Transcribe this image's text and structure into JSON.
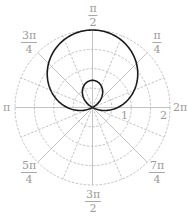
{
  "chart_data": {
    "type": "line",
    "subtype": "polar",
    "title": "",
    "equation_estimate": "r = 0.65 + 1.35 sin(theta)",
    "series": [
      {
        "name": "curve",
        "color": "#1a1a1a",
        "a": 0.65,
        "b": 1.35,
        "theta_range": [
          0,
          6.2832
        ],
        "samples": 360
      }
    ],
    "radial_axis": {
      "range": [
        0,
        2
      ],
      "rings": [
        0.5,
        1,
        1.5,
        2
      ],
      "tick_labels": [
        "1",
        "2"
      ],
      "ring_style": "dashed"
    },
    "angular_axis": {
      "tick_labels": [
        {
          "angle": "pi/4",
          "num": "π",
          "den": "4"
        },
        {
          "angle": "pi/2",
          "num": "π",
          "den": "2"
        },
        {
          "angle": "3pi/4",
          "num": "3π",
          "den": "4"
        },
        {
          "angle": "pi",
          "text": "π"
        },
        {
          "angle": "5pi/4",
          "num": "5π",
          "den": "4"
        },
        {
          "angle": "3pi/2",
          "num": "3π",
          "den": "2"
        },
        {
          "angle": "7pi/4",
          "num": "7π",
          "den": "4"
        },
        {
          "angle": "2pi",
          "text": "2π"
        }
      ],
      "major_spokes_every": "pi/4",
      "minor_spokes_every": "pi/8"
    },
    "grid": true,
    "colors": {
      "curve": "#1a1a1a",
      "grid": "#b4b4b4",
      "labels": "#9a9a9a"
    }
  },
  "labels": {
    "pi_over_2": {
      "num": "π",
      "den": "2"
    },
    "pi_over_4": {
      "num": "π",
      "den": "4"
    },
    "three_pi_over_4": {
      "num": "3π",
      "den": "4"
    },
    "pi": "π",
    "two_pi": "2π",
    "five_pi_over_4": {
      "num": "5π",
      "den": "4"
    },
    "three_pi_over_2": {
      "num": "3π",
      "den": "2"
    },
    "seven_pi_over_4": {
      "num": "7π",
      "den": "4"
    },
    "r1": "1",
    "r2": "2"
  }
}
